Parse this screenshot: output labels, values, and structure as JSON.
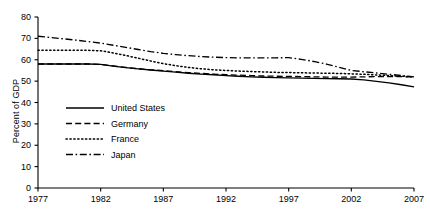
{
  "chart_data": {
    "type": "line",
    "title": "",
    "xlabel": "",
    "ylabel": "Percent of GDP",
    "xlim": [
      1977,
      2007
    ],
    "ylim": [
      0,
      80
    ],
    "ytick_values": [
      0,
      10,
      20,
      30,
      40,
      50,
      60,
      70,
      80
    ],
    "ytick_labels": [
      "0",
      "10",
      "20",
      "30",
      "40",
      "50",
      "60",
      "70",
      "80"
    ],
    "xtick_values": [
      1977,
      1982,
      1987,
      1992,
      1997,
      2002,
      2007
    ],
    "xtick_labels": [
      "1977",
      "1982",
      "1987",
      "1992",
      "1997",
      "2002",
      "2007"
    ],
    "grid": false,
    "legend_position": "center-left",
    "x": [
      1977,
      1978,
      1979,
      1980,
      1981,
      1982,
      1983,
      1984,
      1985,
      1986,
      1987,
      1988,
      1989,
      1990,
      1991,
      1992,
      1993,
      1994,
      1995,
      1996,
      1997,
      1998,
      1999,
      2000,
      2001,
      2002,
      2003,
      2004,
      2005,
      2006,
      2007
    ],
    "series": [
      {
        "name": "United States",
        "style": "solid",
        "color": "#000000",
        "values": [
          58.0,
          58.0,
          58.0,
          58.0,
          58.0,
          57.8,
          57.0,
          56.3,
          55.7,
          55.2,
          54.7,
          54.2,
          53.7,
          53.3,
          53.0,
          52.6,
          52.3,
          52.0,
          51.8,
          51.6,
          51.5,
          51.4,
          51.3,
          51.2,
          51.1,
          51.0,
          50.6,
          49.9,
          49.2,
          48.3,
          47.3
        ]
      },
      {
        "name": "Germany",
        "style": "dashed",
        "color": "#000000",
        "values": [
          58.0,
          58.0,
          58.0,
          58.0,
          58.0,
          57.8,
          57.1,
          56.4,
          55.8,
          55.3,
          54.9,
          54.4,
          54.0,
          53.6,
          53.3,
          53.0,
          52.8,
          52.6,
          52.4,
          52.3,
          52.2,
          52.1,
          52.0,
          51.9,
          51.9,
          51.9,
          52.0,
          52.1,
          52.1,
          52.1,
          52.0
        ]
      },
      {
        "name": "France",
        "style": "dotted",
        "color": "#000000",
        "values": [
          64.5,
          64.5,
          64.5,
          64.5,
          64.4,
          64.2,
          63.2,
          62.0,
          60.7,
          59.4,
          58.2,
          57.2,
          56.4,
          55.8,
          55.3,
          55.0,
          54.7,
          54.5,
          54.3,
          54.1,
          54.0,
          53.9,
          53.8,
          53.7,
          53.6,
          53.4,
          53.2,
          52.9,
          52.6,
          52.3,
          52.0
        ]
      },
      {
        "name": "Japan",
        "style": "dashdot",
        "color": "#000000",
        "values": [
          71.0,
          70.4,
          69.8,
          69.2,
          68.5,
          67.8,
          66.8,
          65.8,
          64.8,
          63.8,
          63.0,
          62.4,
          61.9,
          61.5,
          61.2,
          61.0,
          60.9,
          60.9,
          60.9,
          60.9,
          61.0,
          60.2,
          59.2,
          58.0,
          56.5,
          55.0,
          54.4,
          53.8,
          53.2,
          52.6,
          52.0
        ]
      }
    ],
    "legend": [
      {
        "label": "United States",
        "style": "solid"
      },
      {
        "label": "Germany",
        "style": "dashed"
      },
      {
        "label": "France",
        "style": "dotted"
      },
      {
        "label": "Japan",
        "style": "dashdot"
      }
    ]
  }
}
